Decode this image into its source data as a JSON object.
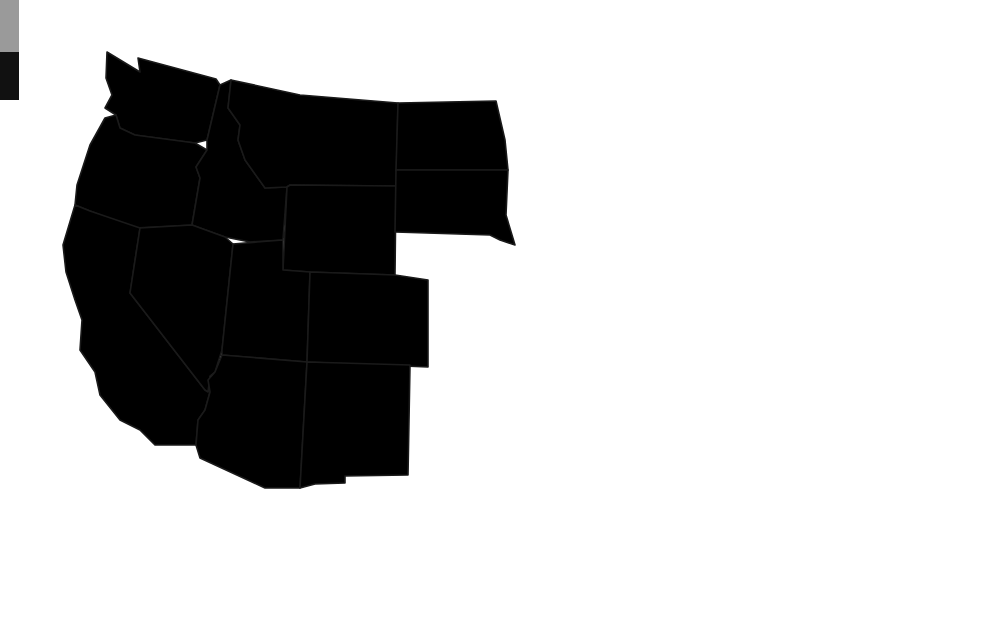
{
  "legend": {
    "items": [
      {
        "name": "category-medium",
        "color": "#9a9a9a",
        "height": 52
      },
      {
        "name": "category-dark",
        "color": "#111111",
        "height": 48
      }
    ]
  },
  "colors": {
    "light": "#cfcfcf",
    "medium": "#969696",
    "dark": "#6b6b6b",
    "border": "#1a1a1a",
    "water": "#ffffff"
  },
  "map": {
    "title": "",
    "states": [
      {
        "id": "WA",
        "name": "Washington",
        "shade": "medium"
      },
      {
        "id": "OR",
        "name": "Oregon",
        "shade": "dark"
      },
      {
        "id": "CA",
        "name": "California",
        "shade": "medium"
      },
      {
        "id": "ID",
        "name": "Idaho",
        "shade": "light"
      },
      {
        "id": "NV",
        "name": "Nevada",
        "shade": "dark"
      },
      {
        "id": "MT",
        "name": "Montana",
        "shade": "medium"
      },
      {
        "id": "WY",
        "name": "Wyoming",
        "shade": "dark"
      },
      {
        "id": "UT",
        "name": "Utah",
        "shade": "medium"
      },
      {
        "id": "AZ",
        "name": "Arizona",
        "shade": "dark"
      },
      {
        "id": "CO",
        "name": "Colorado",
        "shade": "dark"
      },
      {
        "id": "NM",
        "name": "New Mexico",
        "shade": "light"
      },
      {
        "id": "ND",
        "name": "North Dakota",
        "shade": "light"
      },
      {
        "id": "SD",
        "name": "South Dakota",
        "shade": "dark"
      },
      {
        "id": "NE",
        "name": "Nebraska",
        "shade": "light"
      },
      {
        "id": "KS",
        "name": "Kansas",
        "shade": "medium"
      },
      {
        "id": "OK",
        "name": "Oklahoma",
        "shade": "dark"
      },
      {
        "id": "TX",
        "name": "Texas",
        "shade": "medium"
      },
      {
        "id": "MN",
        "name": "Minnesota",
        "shade": "medium"
      },
      {
        "id": "IA",
        "name": "Iowa",
        "shade": "dark"
      },
      {
        "id": "MO",
        "name": "Missouri",
        "shade": "dark"
      },
      {
        "id": "AR",
        "name": "Arkansas",
        "shade": "light"
      },
      {
        "id": "LA",
        "name": "Louisiana",
        "shade": "dark"
      },
      {
        "id": "WI",
        "name": "Wisconsin",
        "shade": "light"
      },
      {
        "id": "IL",
        "name": "Illinois",
        "shade": "medium"
      },
      {
        "id": "MI",
        "name": "Michigan",
        "shade": "medium"
      },
      {
        "id": "IN",
        "name": "Indiana",
        "shade": "light"
      },
      {
        "id": "OH",
        "name": "Ohio",
        "shade": "dark"
      },
      {
        "id": "KY",
        "name": "Kentucky",
        "shade": "dark"
      },
      {
        "id": "TN",
        "name": "Tennessee",
        "shade": "medium"
      },
      {
        "id": "MS",
        "name": "Mississippi",
        "shade": "dark"
      },
      {
        "id": "AL",
        "name": "Alabama",
        "shade": "light"
      },
      {
        "id": "GA",
        "name": "Georgia",
        "shade": "dark"
      },
      {
        "id": "FL",
        "name": "Florida",
        "shade": "medium"
      },
      {
        "id": "SC",
        "name": "South Carolina",
        "shade": "medium"
      },
      {
        "id": "NC",
        "name": "North Carolina",
        "shade": "light"
      },
      {
        "id": "VA",
        "name": "Virginia",
        "shade": "dark"
      },
      {
        "id": "WV",
        "name": "West Virginia",
        "shade": "light"
      },
      {
        "id": "MD",
        "name": "Maryland",
        "shade": "dark"
      },
      {
        "id": "DE",
        "name": "Delaware",
        "shade": "light"
      },
      {
        "id": "PA",
        "name": "Pennsylvania",
        "shade": "medium"
      },
      {
        "id": "NJ",
        "name": "New Jersey",
        "shade": "dark"
      },
      {
        "id": "NY",
        "name": "New York",
        "shade": "light"
      },
      {
        "id": "CT",
        "name": "Connecticut",
        "shade": "medium"
      },
      {
        "id": "RI",
        "name": "Rhode Island",
        "shade": "medium"
      },
      {
        "id": "MA",
        "name": "Massachusetts",
        "shade": "dark"
      },
      {
        "id": "VT",
        "name": "Vermont",
        "shade": "medium"
      },
      {
        "id": "NH",
        "name": "New Hampshire",
        "shade": "light"
      },
      {
        "id": "ME",
        "name": "Maine",
        "shade": "medium"
      }
    ]
  }
}
